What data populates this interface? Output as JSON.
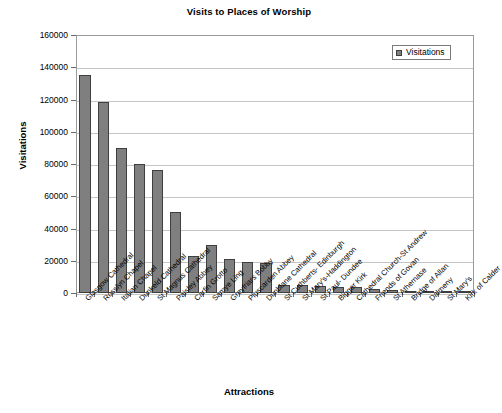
{
  "chart_data": {
    "type": "bar",
    "title": "Visits to Places of Worship",
    "xlabel": "Attractions",
    "ylabel": "Visitations",
    "ylim": [
      0,
      160000
    ],
    "ytick_step": 20000,
    "yticks": [
      "160000",
      "140000",
      "120000",
      "100000",
      "80000",
      "60000",
      "40000",
      "20000",
      "0"
    ],
    "grid": true,
    "legend_position": "top-right",
    "legend_entries": [
      "Visitations"
    ],
    "series_name": "Visitations",
    "bar_color": "#7f7f7f",
    "bar_border_color": "#3f3f3f",
    "categories": [
      "Glasgow Cathedral",
      "Rosslyn Chapel",
      "Italian Chapel",
      "Dunkeld Cathedral",
      "St Magnus Cathedral",
      "Paisley Abbey",
      "Carfin Grotto",
      "Samye Ling",
      "Greyfriars Bobby",
      "Pluscarden Abbey",
      "Dunblane Cathedral",
      "St Cuthberts- Edinburgh",
      "St Mary's-Haddington",
      "St Paul- Dundee",
      "Bigger Kirk",
      "Cathedral Church-St Andrew",
      "Friends of Govan",
      "St Athernase",
      "Bridge of Allan",
      "Dalmeny",
      "St Mary's",
      "Kirk of Calder"
    ],
    "values": [
      135000,
      118500,
      90000,
      80000,
      76000,
      50000,
      23000,
      30000,
      21000,
      19000,
      18500,
      5000,
      5000,
      4500,
      4000,
      3500,
      2500,
      2000,
      1200,
      800,
      600,
      400
    ]
  }
}
